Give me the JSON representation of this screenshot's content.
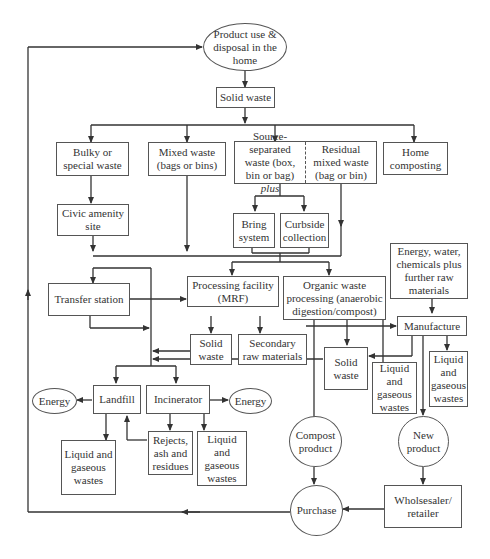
{
  "diagram": {
    "nodes": {
      "product_use": "Product use & disposal in the home",
      "solid_waste_top": "Solid waste",
      "bulky": "Bulky or special waste",
      "mixed": "Mixed waste (bags or bins)",
      "source_separated": "Source-separated waste (box, bin or bag)",
      "source_separated_plus": "plus",
      "residual": "Residual mixed waste (bag or bin)",
      "home_composting": "Home composting",
      "civic": "Civic amenity site",
      "bring": "Bring system",
      "curbside": "Curbside collection",
      "energy_inputs": "Energy, water, chemicals plus further raw materials",
      "transfer": "Transfer station",
      "mrf": "Processing facility (MRF)",
      "organic": "Organic waste processing (anaerobic digestion/compost)",
      "manufacture": "Manufacture",
      "mrf_solid_waste": "Solid waste",
      "secondary_raw": "Secondary raw materials",
      "organic_solid_waste": "Solid waste",
      "organic_liquid": "Liquid and gaseous wastes",
      "manufacture_liquid": "Liquid and gaseous wastes",
      "energy_left": "Energy",
      "landfill": "Landfill",
      "incinerator": "Incinerator",
      "energy_right": "Energy",
      "landfill_liquid": "Liquid and gaseous wastes",
      "rejects": "Rejects, ash and residues",
      "incinerator_liquid": "Liquid and gaseous wastes",
      "compost_product": "Compost product",
      "new_product": "New product",
      "purchase": "Purchase",
      "wholesaler": "Wholsesaler/ retailer"
    }
  }
}
